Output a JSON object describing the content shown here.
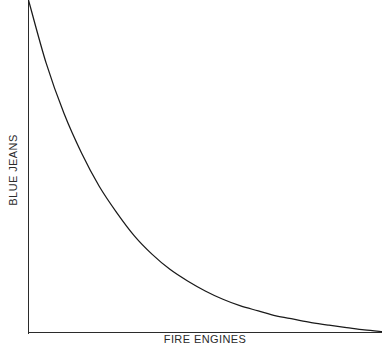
{
  "chart_data": {
    "type": "line",
    "title": "",
    "subtitle": "",
    "xlabel": "FIRE ENGINES",
    "ylabel": "BLUE JEANS",
    "grid": false,
    "legend": null,
    "legend_position": "none",
    "axis_color": "#2b2b2b",
    "line_color": "#1a1a1a",
    "background_color": "#ffffff",
    "xlim": [
      0,
      100
    ],
    "ylim": [
      0,
      100
    ],
    "xticks": [],
    "yticks": [],
    "annotations": [],
    "series": [
      {
        "name": "blue-jeans-vs-fire-engines",
        "description": "monotonically decreasing exponential decay curve",
        "x": [
          0,
          5,
          10,
          15,
          20,
          25,
          30,
          35,
          40,
          45,
          50,
          55,
          60,
          65,
          70,
          75,
          80,
          85,
          90,
          95,
          100
        ],
        "y": [
          100,
          81,
          66,
          54,
          44,
          36,
          29,
          23.5,
          19,
          15.5,
          12.5,
          10,
          8,
          6.5,
          5,
          4,
          3,
          2.2,
          1.5,
          0.8,
          0.3
        ]
      }
    ]
  }
}
